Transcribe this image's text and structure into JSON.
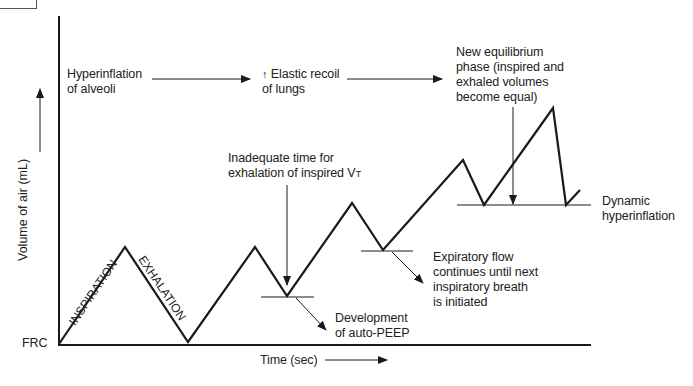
{
  "axes": {
    "y_label": "Volume of air (mL)",
    "x_label": "Time (sec)",
    "baseline_label": "FRC"
  },
  "phases": {
    "inspiration": "INSPIRATION",
    "exhalation": "EXHALATION"
  },
  "flow_chain": {
    "step1": [
      "Hyperinflation",
      "of alveoli"
    ],
    "step2_arrow_glyph": "↑",
    "step2": [
      "Elastic recoil",
      "of lungs"
    ],
    "step3": [
      "New equilibrium",
      "phase (inspired and",
      "exhaled volumes",
      "become equal)"
    ]
  },
  "annotations": {
    "inadequate_time": [
      "Inadequate time for",
      "exhalation of inspired V"
    ],
    "inadequate_time_subscript": "T",
    "auto_peep": [
      "Development",
      "of auto-PEEP"
    ],
    "expiratory_flow": [
      "Expiratory flow",
      "continues until next",
      "inspiratory breath",
      "is initiated"
    ],
    "dynamic_hyperinflation": [
      "Dynamic",
      "hyperinflation"
    ]
  },
  "colors": {
    "line": "#1a1a1a",
    "text": "#222222",
    "background": "#ffffff"
  },
  "waveform_points": [
    [
      58,
      344
    ],
    [
      125,
      247
    ],
    [
      188,
      342
    ],
    [
      255,
      247
    ],
    [
      287,
      296
    ],
    [
      352,
      203
    ],
    [
      383,
      250
    ],
    [
      463,
      160
    ],
    [
      484,
      205
    ],
    [
      553,
      108
    ],
    [
      566,
      205
    ],
    [
      580,
      190
    ]
  ]
}
